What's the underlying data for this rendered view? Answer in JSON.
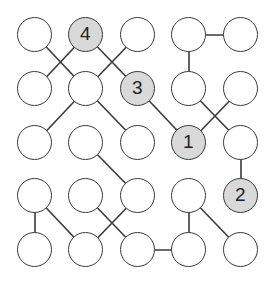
{
  "puzzle": {
    "type": "node-link puzzle",
    "columns": 5,
    "rows": 5,
    "layout": {
      "col_x": [
        35,
        86,
        138,
        189,
        241
      ],
      "row_y": [
        35,
        89,
        143,
        196,
        250
      ],
      "radius": 17.5
    },
    "colors": {
      "node_fill": "#ffffff",
      "clue_fill": "#d9d9d9",
      "stroke": "#3a3a3a",
      "text": "#222222"
    },
    "nodes": [
      {
        "r": 0,
        "c": 0,
        "label": ""
      },
      {
        "r": 0,
        "c": 1,
        "label": "4"
      },
      {
        "r": 0,
        "c": 2,
        "label": ""
      },
      {
        "r": 0,
        "c": 3,
        "label": ""
      },
      {
        "r": 0,
        "c": 4,
        "label": ""
      },
      {
        "r": 1,
        "c": 0,
        "label": ""
      },
      {
        "r": 1,
        "c": 1,
        "label": ""
      },
      {
        "r": 1,
        "c": 2,
        "label": "3"
      },
      {
        "r": 1,
        "c": 3,
        "label": ""
      },
      {
        "r": 1,
        "c": 4,
        "label": ""
      },
      {
        "r": 2,
        "c": 0,
        "label": ""
      },
      {
        "r": 2,
        "c": 1,
        "label": ""
      },
      {
        "r": 2,
        "c": 2,
        "label": ""
      },
      {
        "r": 2,
        "c": 3,
        "label": "1"
      },
      {
        "r": 2,
        "c": 4,
        "label": ""
      },
      {
        "r": 3,
        "c": 0,
        "label": ""
      },
      {
        "r": 3,
        "c": 1,
        "label": ""
      },
      {
        "r": 3,
        "c": 2,
        "label": ""
      },
      {
        "r": 3,
        "c": 3,
        "label": ""
      },
      {
        "r": 3,
        "c": 4,
        "label": "2"
      },
      {
        "r": 4,
        "c": 0,
        "label": ""
      },
      {
        "r": 4,
        "c": 1,
        "label": ""
      },
      {
        "r": 4,
        "c": 2,
        "label": ""
      },
      {
        "r": 4,
        "c": 3,
        "label": ""
      },
      {
        "r": 4,
        "c": 4,
        "label": ""
      }
    ],
    "edges": [
      [
        [
          0,
          0
        ],
        [
          1,
          1
        ]
      ],
      [
        [
          0,
          1
        ],
        [
          1,
          0
        ]
      ],
      [
        [
          0,
          1
        ],
        [
          1,
          2
        ]
      ],
      [
        [
          0,
          2
        ],
        [
          1,
          1
        ]
      ],
      [
        [
          0,
          3
        ],
        [
          0,
          4
        ]
      ],
      [
        [
          0,
          3
        ],
        [
          1,
          3
        ]
      ],
      [
        [
          1,
          1
        ],
        [
          2,
          0
        ]
      ],
      [
        [
          1,
          1
        ],
        [
          2,
          2
        ]
      ],
      [
        [
          1,
          2
        ],
        [
          2,
          3
        ]
      ],
      [
        [
          1,
          3
        ],
        [
          2,
          4
        ]
      ],
      [
        [
          1,
          4
        ],
        [
          2,
          3
        ]
      ],
      [
        [
          2,
          4
        ],
        [
          3,
          4
        ]
      ],
      [
        [
          2,
          1
        ],
        [
          3,
          2
        ]
      ],
      [
        [
          3,
          0
        ],
        [
          4,
          0
        ]
      ],
      [
        [
          3,
          0
        ],
        [
          4,
          1
        ]
      ],
      [
        [
          3,
          1
        ],
        [
          4,
          2
        ]
      ],
      [
        [
          3,
          2
        ],
        [
          4,
          1
        ]
      ],
      [
        [
          4,
          2
        ],
        [
          4,
          3
        ]
      ],
      [
        [
          3,
          3
        ],
        [
          4,
          3
        ]
      ],
      [
        [
          3,
          3
        ],
        [
          4,
          4
        ]
      ]
    ]
  }
}
